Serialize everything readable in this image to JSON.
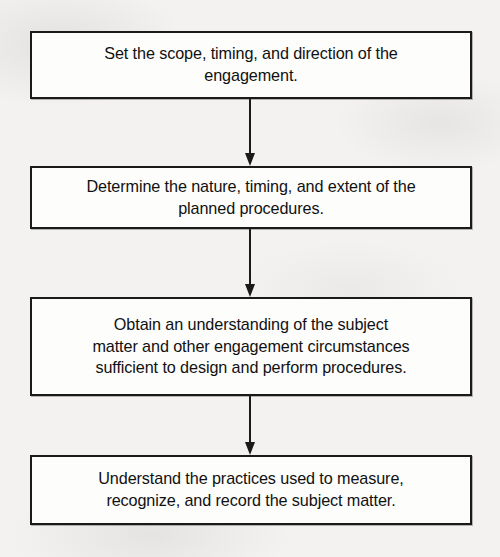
{
  "diagram": {
    "type": "vertical-flowchart",
    "orientation": "top-to-bottom",
    "background_color": "#f3f2f0",
    "box_fill_color": "#fdfdfc",
    "box_border_color": "#1a1a1a",
    "text_color": "#111111",
    "connector_color": "#1a1a1a",
    "step_count": 4,
    "nodes": [
      {
        "id": "step-1",
        "order": 1,
        "text": "Set the scope, timing, and direction of the\nengagement.",
        "lines": [
          "Set the scope, timing, and direction of the",
          "engagement."
        ]
      },
      {
        "id": "step-2",
        "order": 2,
        "text": "Determine the nature, timing, and extent of the\nplanned procedures.",
        "lines": [
          "Determine the nature, timing, and extent of the",
          "planned procedures."
        ]
      },
      {
        "id": "step-3",
        "order": 3,
        "text": "Obtain an understanding of the subject\nmatter and other engagement circumstances\nsufficient to design and perform procedures.",
        "lines": [
          "Obtain an understanding of the subject",
          "matter and other engagement circumstances",
          "sufficient to design and perform procedures."
        ]
      },
      {
        "id": "step-4",
        "order": 4,
        "text": "Understand the practices used to measure,\nrecognize, and record the subject matter.",
        "lines": [
          "Understand the practices used to measure,",
          "recognize, and record the subject matter."
        ]
      }
    ],
    "connectors": [
      {
        "id": "connector-1",
        "from": "step-1",
        "to": "step-2",
        "icon": "down-arrow-icon"
      },
      {
        "id": "connector-2",
        "from": "step-2",
        "to": "step-3",
        "icon": "down-arrow-icon"
      },
      {
        "id": "connector-3",
        "from": "step-3",
        "to": "step-4",
        "icon": "down-arrow-icon"
      }
    ]
  }
}
